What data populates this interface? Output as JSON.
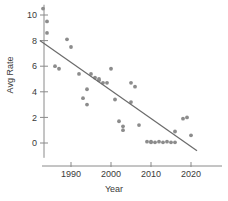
{
  "chart_data": {
    "type": "scatter",
    "title": "",
    "xlabel": "Year",
    "ylabel": "Avg Rate",
    "xlim": [
      1982,
      2023
    ],
    "ylim": [
      -1,
      10.8
    ],
    "grid": false,
    "legend": "none",
    "xticks": [
      1990,
      2000,
      2010,
      2020
    ],
    "yticks": [
      0,
      2,
      4,
      6,
      8,
      10
    ],
    "point_color": "#8c8c8c",
    "line_color": "#6b6b6b",
    "axis_color": "#8a8a8a",
    "text_color": "#3a3a3a",
    "series": [
      {
        "name": "Avg Rate",
        "points": [
          [
            1983,
            10.5
          ],
          [
            1984,
            9.5
          ],
          [
            1984,
            8.6
          ],
          [
            1986,
            6.0
          ],
          [
            1987,
            5.8
          ],
          [
            1989,
            8.1
          ],
          [
            1990,
            7.5
          ],
          [
            1992,
            5.4
          ],
          [
            1993,
            3.5
          ],
          [
            1994,
            3.0
          ],
          [
            1994,
            4.2
          ],
          [
            1995,
            5.4
          ],
          [
            1996,
            5.1
          ],
          [
            1997,
            5.0
          ],
          [
            1997,
            4.9
          ],
          [
            1998,
            4.7
          ],
          [
            1999,
            4.7
          ],
          [
            2000,
            5.8
          ],
          [
            2001,
            3.4
          ],
          [
            2002,
            1.7
          ],
          [
            2003,
            1.0
          ],
          [
            2003,
            1.3
          ],
          [
            2005,
            3.2
          ],
          [
            2005,
            4.7
          ],
          [
            2006,
            4.4
          ],
          [
            2007,
            1.4
          ],
          [
            2009,
            0.1
          ],
          [
            2010,
            0.1
          ],
          [
            2010,
            0.05
          ],
          [
            2011,
            0.05
          ],
          [
            2012,
            0.1
          ],
          [
            2013,
            0.05
          ],
          [
            2014,
            0.1
          ],
          [
            2015,
            0.05
          ],
          [
            2016,
            0.05
          ],
          [
            2016,
            0.9
          ],
          [
            2018,
            1.9
          ],
          [
            2019,
            2.0
          ],
          [
            2020,
            0.6
          ]
        ]
      }
    ],
    "trend_line": {
      "name": "linear fit",
      "x_start": 1982.2,
      "y_start": 8.0,
      "x_end": 2021.5,
      "y_end": -0.6
    }
  }
}
